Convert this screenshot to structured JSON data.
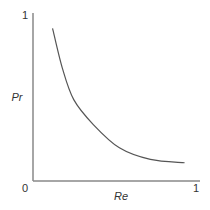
{
  "chart_data": {
    "type": "line",
    "title": "",
    "xlabel": "Re",
    "ylabel": "Pr",
    "xlim": [
      0,
      1
    ],
    "ylim": [
      0,
      1
    ],
    "x_ticks": [
      {
        "value": 0,
        "label": "0"
      },
      {
        "value": 1,
        "label": "1"
      }
    ],
    "y_ticks": [
      {
        "value": 1,
        "label": "1"
      }
    ],
    "grid": false,
    "series": [
      {
        "name": "Pr vs Re",
        "color": "#555555",
        "x": [
          0.12,
          0.18,
          0.25,
          0.37,
          0.53,
          0.72,
          0.93
        ],
        "y": [
          0.92,
          0.68,
          0.49,
          0.34,
          0.2,
          0.13,
          0.11
        ]
      }
    ]
  }
}
